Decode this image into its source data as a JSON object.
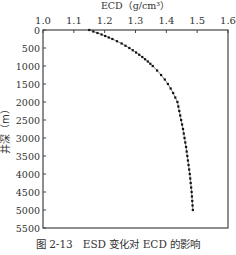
{
  "chart_data": {
    "type": "line",
    "title": "ECD（g/cm³）",
    "xlabel": "ECD（g/cm³）",
    "ylabel": "井深（m）",
    "x_axis_position": "top",
    "y_inverted": true,
    "xlim": [
      1.0,
      1.6
    ],
    "ylim": [
      0,
      5500
    ],
    "xticks": [
      "1.0",
      "1.1",
      "1.2",
      "1.3",
      "1.4",
      "1.5",
      "1.6"
    ],
    "yticks": [
      "0",
      "500",
      "1000",
      "1500",
      "2000",
      "2500",
      "3000",
      "3500",
      "4000",
      "4500",
      "5000",
      "5500"
    ],
    "grid": false,
    "legend": null,
    "series": [
      {
        "name": "ECD",
        "marker": "square",
        "color": "#111111",
        "points": [
          {
            "ecd": 1.15,
            "depth": 0
          },
          {
            "ecd": 1.19,
            "depth": 125
          },
          {
            "ecd": 1.225,
            "depth": 250
          },
          {
            "ecd": 1.255,
            "depth": 375
          },
          {
            "ecd": 1.28,
            "depth": 500
          },
          {
            "ecd": 1.302,
            "depth": 625
          },
          {
            "ecd": 1.322,
            "depth": 750
          },
          {
            "ecd": 1.34,
            "depth": 875
          },
          {
            "ecd": 1.356,
            "depth": 1000
          },
          {
            "ecd": 1.37,
            "depth": 1125
          },
          {
            "ecd": 1.383,
            "depth": 1250
          },
          {
            "ecd": 1.395,
            "depth": 1375
          },
          {
            "ecd": 1.405,
            "depth": 1500
          },
          {
            "ecd": 1.414,
            "depth": 1625
          },
          {
            "ecd": 1.422,
            "depth": 1750
          },
          {
            "ecd": 1.429,
            "depth": 1875
          },
          {
            "ecd": 1.436,
            "depth": 2000
          },
          {
            "ecd": 1.442,
            "depth": 2250
          },
          {
            "ecd": 1.448,
            "depth": 2500
          },
          {
            "ecd": 1.454,
            "depth": 2750
          },
          {
            "ecd": 1.459,
            "depth": 3000
          },
          {
            "ecd": 1.464,
            "depth": 3250
          },
          {
            "ecd": 1.468,
            "depth": 3500
          },
          {
            "ecd": 1.472,
            "depth": 3750
          },
          {
            "ecd": 1.476,
            "depth": 4000
          },
          {
            "ecd": 1.479,
            "depth": 4250
          },
          {
            "ecd": 1.482,
            "depth": 4500
          },
          {
            "ecd": 1.484,
            "depth": 4750
          },
          {
            "ecd": 1.486,
            "depth": 5000
          }
        ]
      }
    ]
  },
  "caption": "图 2-13　ESD 变化对 ECD 的影响"
}
